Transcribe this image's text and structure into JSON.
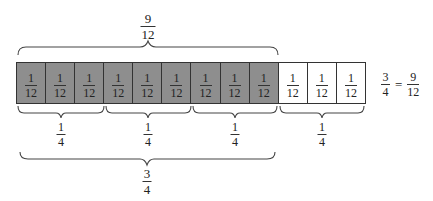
{
  "diagram": {
    "cells": [
      {
        "num": "1",
        "den": "12",
        "shaded": true
      },
      {
        "num": "1",
        "den": "12",
        "shaded": true
      },
      {
        "num": "1",
        "den": "12",
        "shaded": true
      },
      {
        "num": "1",
        "den": "12",
        "shaded": true
      },
      {
        "num": "1",
        "den": "12",
        "shaded": true
      },
      {
        "num": "1",
        "den": "12",
        "shaded": true
      },
      {
        "num": "1",
        "den": "12",
        "shaded": true
      },
      {
        "num": "1",
        "den": "12",
        "shaded": true
      },
      {
        "num": "1",
        "den": "12",
        "shaded": true
      },
      {
        "num": "1",
        "den": "12",
        "shaded": false
      },
      {
        "num": "1",
        "den": "12",
        "shaded": false
      },
      {
        "num": "1",
        "den": "12",
        "shaded": false
      }
    ],
    "top_brace": {
      "num": "9",
      "den": "12",
      "spans_cells": [
        1,
        9
      ]
    },
    "quarter_braces": [
      {
        "num": "1",
        "den": "4",
        "spans_cells": [
          1,
          3
        ]
      },
      {
        "num": "1",
        "den": "4",
        "spans_cells": [
          4,
          6
        ]
      },
      {
        "num": "1",
        "den": "4",
        "spans_cells": [
          7,
          9
        ]
      },
      {
        "num": "1",
        "den": "4",
        "spans_cells": [
          10,
          12
        ]
      }
    ],
    "bottom_brace": {
      "num": "3",
      "den": "4",
      "spans_cells": [
        1,
        9
      ]
    },
    "equation": {
      "left_num": "3",
      "left_den": "4",
      "op": "=",
      "right_num": "9",
      "right_den": "12"
    },
    "colors": {
      "shaded": "#8e8e8e",
      "unshaded": "#ffffff",
      "line": "#333333"
    }
  }
}
